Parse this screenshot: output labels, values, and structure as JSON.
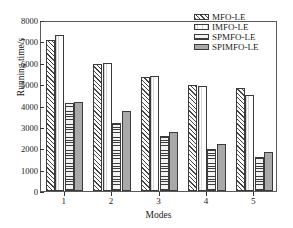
{
  "chart_data": {
    "type": "bar",
    "title": "",
    "xlabel": "Modes",
    "ylabel": "Running time/s",
    "categories": [
      "1",
      "2",
      "3",
      "4",
      "5"
    ],
    "ylim": [
      0,
      8000
    ],
    "yticks": [
      0,
      1000,
      2000,
      3000,
      4000,
      5000,
      6000,
      7000,
      8000
    ],
    "ytick_labels": [
      "0",
      "1000",
      "2000",
      "3000",
      "4000",
      "5000",
      "6000",
      "7000",
      "8000"
    ],
    "grid": false,
    "legend_position": "top-right",
    "series": [
      {
        "name": "MFO-LE",
        "pattern": "diagonal-hatch",
        "values": [
          7050,
          5920,
          5320,
          4950,
          4820
        ]
      },
      {
        "name": "IMFO-LE",
        "pattern": "blank",
        "values": [
          7320,
          5990,
          5400,
          4890,
          4490
        ]
      },
      {
        "name": "SPMFO-LE",
        "pattern": "horizontal-lines",
        "values": [
          4100,
          3180,
          2580,
          1960,
          1570
        ]
      },
      {
        "name": "SPIMFO-LE",
        "pattern": "solid-gray",
        "values": [
          4170,
          3740,
          2780,
          2220,
          1830
        ]
      }
    ]
  }
}
